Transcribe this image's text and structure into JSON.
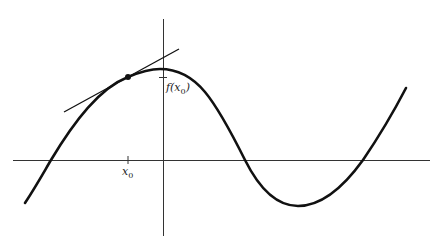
{
  "diagram": {
    "labels": {
      "x0": {
        "main": "x",
        "sub": "0"
      },
      "fx0": {
        "pre": "f(x",
        "sub": "0",
        "post": ")"
      }
    },
    "colors": {
      "curve": "#111111",
      "axes": "#333333",
      "tangent": "#111111",
      "background": "#ffffff"
    }
  }
}
